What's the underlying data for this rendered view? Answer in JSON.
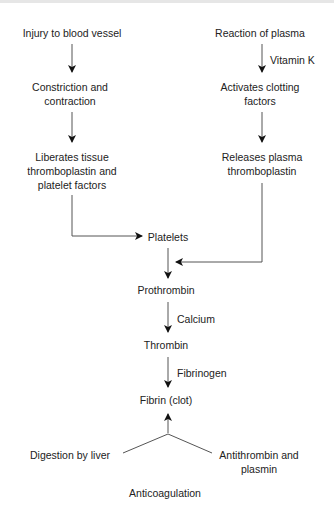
{
  "diagram": {
    "left_branch": {
      "step1": "Injury to blood vessel",
      "step2": [
        "Constriction and",
        "contraction"
      ],
      "step3": [
        "Liberates tissue",
        "thromboplastin and",
        "platelet factors"
      ]
    },
    "right_branch": {
      "step1": "Reaction of plasma",
      "edge1_label": "Vitamin K",
      "step2": [
        "Activates clotting",
        "factors"
      ],
      "step3": [
        "Releases plasma",
        "thromboplastin"
      ]
    },
    "center": {
      "platelets": "Platelets",
      "prothrombin": "Prothrombin",
      "edge_calcium": "Calcium",
      "thrombin": "Thrombin",
      "edge_fibrinogen": "Fibrinogen",
      "fibrin": "Fibrin (clot)"
    },
    "bottom": {
      "left": "Digestion by liver",
      "right": [
        "Antithrombin and",
        "plasmin"
      ],
      "anticoagulation": "Anticoagulation"
    },
    "colors": {
      "line": "#555555",
      "text": "#222222"
    }
  }
}
